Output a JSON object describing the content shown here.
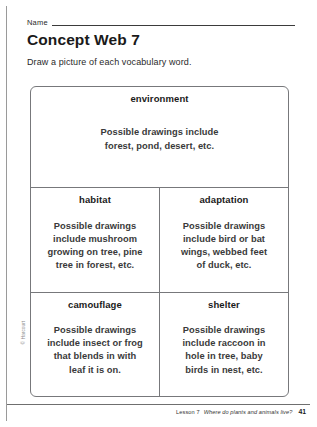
{
  "header": {
    "name_label": "Name",
    "title": "Concept Web 7",
    "instruction": "Draw a picture of each vocabulary word."
  },
  "concept_web": {
    "top": {
      "term": "environment",
      "answer": "Possible drawings include\nforest, pond, desert, etc."
    },
    "cells": [
      {
        "term": "habitat",
        "answer": "Possible drawings\ninclude mushroom\ngrowing on tree, pine\ntree in forest, etc."
      },
      {
        "term": "adaptation",
        "answer": "Possible drawings\ninclude bird or bat\nwings, webbed feet\nof duck, etc."
      },
      {
        "term": "camouflage",
        "answer": "Possible drawings\ninclude insect or frog\nthat blends in with\nleaf it is on."
      },
      {
        "term": "shelter",
        "answer": "Possible drawings\ninclude raccoon in\nhole in tree, baby\nbirds in nest, etc."
      }
    ]
  },
  "footer": {
    "lesson": "Lesson 7",
    "lesson_title": "Where do plants and animals live?",
    "page_number": "41",
    "copyright": "© Harcourt"
  }
}
